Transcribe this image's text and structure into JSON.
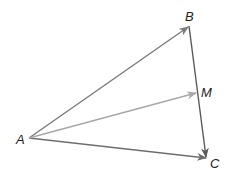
{
  "diagram": {
    "type": "vector-triangle",
    "points": {
      "A": {
        "label": "A",
        "x": 29,
        "y": 138
      },
      "B": {
        "label": "B",
        "x": 189,
        "y": 26
      },
      "C": {
        "label": "C",
        "x": 207,
        "y": 158
      },
      "M": {
        "label": "M",
        "x": 197,
        "y": 93
      }
    },
    "vectors": [
      {
        "from": "A",
        "to": "B",
        "color": "#7a7a7a"
      },
      {
        "from": "A",
        "to": "C",
        "color": "#6e6e6e"
      },
      {
        "from": "B",
        "to": "C",
        "color": "#5a5a5a"
      },
      {
        "from": "A",
        "to": "M",
        "color": "#a8a8a8"
      }
    ]
  }
}
